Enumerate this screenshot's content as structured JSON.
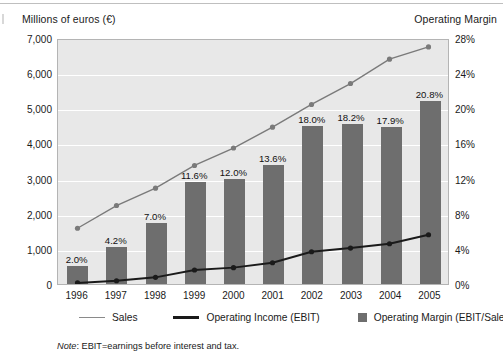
{
  "chart_data": {
    "type": "bar",
    "title": "",
    "categories": [
      "1996",
      "1997",
      "1998",
      "1999",
      "2000",
      "2001",
      "2002",
      "2003",
      "2004",
      "2005"
    ],
    "left_axis": {
      "label": "Millions of euros (€)",
      "ticks": [
        "0",
        "1,000",
        "2,000",
        "3,000",
        "4,000",
        "5,000",
        "6,000",
        "7,000"
      ],
      "tick_values": [
        0,
        1000,
        2000,
        3000,
        4000,
        5000,
        6000,
        7000
      ],
      "ylim": [
        0,
        7000
      ]
    },
    "right_axis": {
      "label": "Operating Margin",
      "ticks": [
        "0%",
        "4%",
        "8%",
        "12%",
        "16%",
        "20%",
        "24%",
        "28%"
      ],
      "tick_values": [
        0,
        4,
        8,
        12,
        16,
        20,
        24,
        28
      ],
      "ylim": [
        0,
        28
      ]
    },
    "series": [
      {
        "name": "Operating Margin (EBIT/Sales)",
        "type": "bar",
        "axis": "right",
        "unit": "%",
        "color": "#6e6e6e",
        "values": [
          2.0,
          4.2,
          7.0,
          11.6,
          12.0,
          13.6,
          18.0,
          18.2,
          17.9,
          20.8
        ],
        "data_labels": [
          "2.0%",
          "4.2%",
          "7.0%",
          "11.6%",
          "12.0%",
          "13.6%",
          "18.0%",
          "18.2%",
          "17.9%",
          "20.8%"
        ]
      },
      {
        "name": "Sales",
        "type": "line",
        "axis": "left",
        "unit": "millions of euros",
        "color": "#7a7a7a",
        "values": [
          1600,
          2250,
          2750,
          3400,
          3900,
          4500,
          5150,
          5750,
          6450,
          6800
        ]
      },
      {
        "name": "Operating Income (EBIT)",
        "type": "line",
        "axis": "left",
        "unit": "millions of euros",
        "color": "#1a1a1a",
        "values": [
          30,
          95,
          190,
          400,
          470,
          610,
          925,
          1030,
          1155,
          1415
        ]
      }
    ],
    "legend": {
      "position": "bottom",
      "entries": [
        {
          "label": "Sales",
          "marker": "line-thin"
        },
        {
          "label": "Operating Income (EBIT)",
          "marker": "line-thick"
        },
        {
          "label": "Operating Margin (EBIT/Sales)",
          "marker": "square"
        }
      ]
    },
    "grid": true,
    "note_prefix": "Note",
    "note_text": ": EBIT=earnings before interest and tax."
  }
}
